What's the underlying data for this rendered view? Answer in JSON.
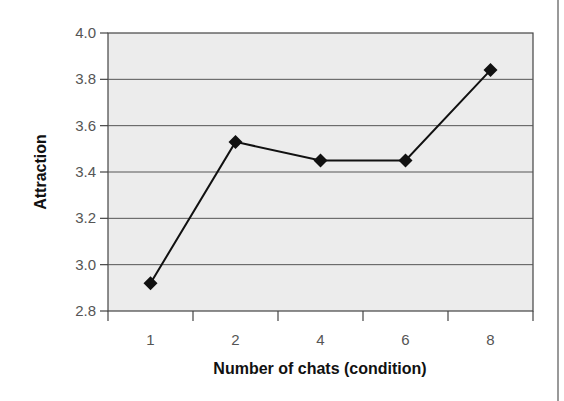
{
  "chart_data": {
    "type": "line",
    "title": "",
    "xlabel": "Number of chats (condition)",
    "ylabel": "Attraction",
    "categories": [
      "1",
      "2",
      "4",
      "6",
      "8"
    ],
    "series": [
      {
        "name": "Attraction",
        "values": [
          2.92,
          3.53,
          3.45,
          3.45,
          3.84
        ],
        "marker": "diamond",
        "color": "#111111"
      }
    ],
    "ylim": [
      2.8,
      4.0
    ],
    "yticks": [
      "2.8",
      "3.0",
      "3.2",
      "3.4",
      "3.6",
      "3.8",
      "4.0"
    ],
    "grid": true,
    "legend": "none",
    "plot_background": "#ededed"
  }
}
